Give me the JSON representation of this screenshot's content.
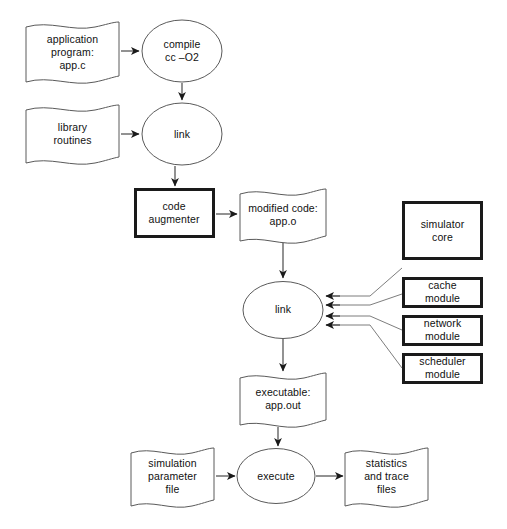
{
  "diagram": {
    "background_color": "#ffffff",
    "line_color": "#3a3a3a",
    "thick_border_color": "#1a1a1a",
    "nodes": [
      {
        "id": "app-source",
        "label": "application\nprogram:\napp.c",
        "shape": "document",
        "x": 26,
        "y": 22,
        "w": 93,
        "h": 60
      },
      {
        "id": "compile",
        "label": "compile\ncc –O2",
        "shape": "ellipse",
        "x": 142,
        "y": 20,
        "w": 80,
        "h": 62
      },
      {
        "id": "library-routines",
        "label": "library\nroutines",
        "shape": "document",
        "x": 26,
        "y": 105,
        "w": 93,
        "h": 57
      },
      {
        "id": "link-1",
        "label": "link",
        "shape": "ellipse",
        "x": 142,
        "y": 103,
        "w": 80,
        "h": 62
      },
      {
        "id": "code-augmenter",
        "label": "code\naugmenter",
        "shape": "rect-thick",
        "x": 134,
        "y": 188,
        "w": 80,
        "h": 50
      },
      {
        "id": "modified-code",
        "label": "modified code:\napp.o",
        "shape": "document",
        "x": 240,
        "y": 189,
        "w": 86,
        "h": 52
      },
      {
        "id": "simulator-core",
        "label": "simulator\ncore",
        "shape": "rect-thick",
        "x": 402,
        "y": 201,
        "w": 81,
        "h": 59
      },
      {
        "id": "cache-module",
        "label": "cache\nmodule",
        "shape": "rect-thick",
        "x": 402,
        "y": 277,
        "w": 81,
        "h": 31
      },
      {
        "id": "link-2",
        "label": "link",
        "shape": "ellipse",
        "x": 243,
        "y": 281,
        "w": 80,
        "h": 57
      },
      {
        "id": "network-module",
        "label": "network\nmodule",
        "shape": "rect-thick",
        "x": 402,
        "y": 315,
        "w": 81,
        "h": 31
      },
      {
        "id": "scheduler-module",
        "label": "scheduler\nmodule",
        "shape": "rect-thick",
        "x": 402,
        "y": 353,
        "w": 81,
        "h": 31
      },
      {
        "id": "executable",
        "label": "executable:\napp.out",
        "shape": "document",
        "x": 240,
        "y": 373,
        "w": 86,
        "h": 52
      },
      {
        "id": "sim-param-file",
        "label": "simulation\nparameter\nfile",
        "shape": "document",
        "x": 131,
        "y": 448,
        "w": 83,
        "h": 57
      },
      {
        "id": "execute",
        "label": "execute",
        "shape": "ellipse",
        "x": 237,
        "y": 449,
        "w": 78,
        "h": 55
      },
      {
        "id": "stats-trace",
        "label": "statistics\nand trace\nfiles",
        "parse_note": "",
        "shape": "document",
        "x": 345,
        "y": 448,
        "w": 83,
        "h": 57
      }
    ],
    "edges": [
      {
        "from": "app-source",
        "to": "compile",
        "kind": "arrow-right"
      },
      {
        "from": "compile",
        "to": "link-1",
        "kind": "arrow-down"
      },
      {
        "from": "library-routines",
        "to": "link-1",
        "kind": "arrow-right"
      },
      {
        "from": "link-1",
        "to": "code-augmenter",
        "kind": "arrow-down"
      },
      {
        "from": "code-augmenter",
        "to": "modified-code",
        "kind": "arrow-right"
      },
      {
        "from": "modified-code",
        "to": "link-2",
        "kind": "arrow-down"
      },
      {
        "from": "simulator-core",
        "to": "link-2",
        "kind": "arrow-left-elbow"
      },
      {
        "from": "cache-module",
        "to": "link-2",
        "kind": "arrow-left-elbow"
      },
      {
        "from": "network-module",
        "to": "link-2",
        "kind": "arrow-left-elbow"
      },
      {
        "from": "scheduler-module",
        "to": "link-2",
        "kind": "arrow-left-elbow"
      },
      {
        "from": "link-2",
        "to": "executable",
        "kind": "arrow-down"
      },
      {
        "from": "executable",
        "to": "execute",
        "kind": "arrow-down"
      },
      {
        "from": "sim-param-file",
        "to": "execute",
        "kind": "arrow-right"
      },
      {
        "from": "execute",
        "to": "stats-trace",
        "kind": "arrow-right"
      }
    ]
  }
}
